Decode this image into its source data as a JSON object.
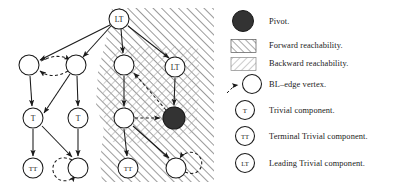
{
  "figure": {
    "colors": {
      "ink": "#1a1a1a",
      "pivot_fill": "#333333",
      "node_fill": "#ffffff",
      "hatch_forward": "#808080",
      "hatch_backward": "#aaaaaa"
    }
  },
  "legend": {
    "items": [
      {
        "key": "pivot",
        "symbol": "filled-circle",
        "label": "Pivot."
      },
      {
        "key": "forward",
        "symbol": "forward-hatch-box",
        "label": "Forward reachability."
      },
      {
        "key": "backward",
        "symbol": "backward-hatch-box",
        "label": "Backward reachability."
      },
      {
        "key": "bl_edge",
        "symbol": "dashed-arrow-circle",
        "label": "BL–edge vertex."
      },
      {
        "key": "trivial",
        "symbol": "circle-T",
        "label": "Trivial component.",
        "node_text": "T"
      },
      {
        "key": "terminal",
        "symbol": "circle-TT",
        "label": "Terminal Trivial component.",
        "node_text": "TT"
      },
      {
        "key": "leading",
        "symbol": "circle-LT",
        "label": "Leading Trivial component.",
        "node_text": "LT"
      }
    ]
  },
  "graph": {
    "nodes": [
      {
        "id": "n_lt_top",
        "label": "LT",
        "x": 119,
        "y": 19,
        "r": 10,
        "fill": "white"
      },
      {
        "id": "n_a",
        "label": "",
        "x": 29,
        "y": 65,
        "r": 10,
        "fill": "white"
      },
      {
        "id": "n_b",
        "label": "",
        "x": 76,
        "y": 65,
        "r": 10,
        "fill": "white"
      },
      {
        "id": "n_c",
        "label": "",
        "x": 124,
        "y": 65,
        "r": 10,
        "fill": "white"
      },
      {
        "id": "n_lt_r",
        "label": "LT",
        "x": 175,
        "y": 67,
        "r": 10,
        "fill": "white"
      },
      {
        "id": "n_t1",
        "label": "T",
        "x": 33,
        "y": 118,
        "r": 10,
        "fill": "white"
      },
      {
        "id": "n_t2",
        "label": "T",
        "x": 78,
        "y": 118,
        "r": 10,
        "fill": "white"
      },
      {
        "id": "n_d",
        "label": "",
        "x": 124,
        "y": 118,
        "r": 10,
        "fill": "white"
      },
      {
        "id": "n_pivot",
        "label": "",
        "x": 174,
        "y": 118,
        "r": 11,
        "fill": "pivot"
      },
      {
        "id": "n_tt1",
        "label": "TT",
        "x": 33,
        "y": 168,
        "r": 10,
        "fill": "white"
      },
      {
        "id": "n_e",
        "label": "",
        "x": 78,
        "y": 168,
        "r": 10,
        "fill": "white"
      },
      {
        "id": "n_tt2",
        "label": "TT",
        "x": 128,
        "y": 168,
        "r": 10,
        "fill": "white"
      },
      {
        "id": "n_f",
        "label": "",
        "x": 176,
        "y": 168,
        "r": 10,
        "fill": "white"
      }
    ],
    "edges": [
      {
        "from": "n_lt_top",
        "to": "n_a",
        "style": "solid"
      },
      {
        "from": "n_lt_top",
        "to": "n_b",
        "style": "solid"
      },
      {
        "from": "n_lt_top",
        "to": "n_c",
        "style": "solid"
      },
      {
        "from": "n_lt_top",
        "to": "n_lt_r",
        "style": "solid"
      },
      {
        "from": "n_a",
        "to": "n_b",
        "style": "dashed-bidirectional"
      },
      {
        "from": "n_a",
        "to": "n_t1",
        "style": "solid"
      },
      {
        "from": "n_b",
        "to": "n_t1",
        "style": "solid"
      },
      {
        "from": "n_b",
        "to": "n_t2",
        "style": "solid"
      },
      {
        "from": "n_c",
        "to": "n_d",
        "style": "solid"
      },
      {
        "from": "n_lt_r",
        "to": "n_pivot",
        "style": "solid"
      },
      {
        "from": "n_pivot",
        "to": "n_c",
        "style": "dashed"
      },
      {
        "from": "n_d",
        "to": "n_pivot",
        "style": "dashed"
      },
      {
        "from": "n_t1",
        "to": "n_tt1",
        "style": "solid"
      },
      {
        "from": "n_t1",
        "to": "n_e",
        "style": "solid"
      },
      {
        "from": "n_t2",
        "to": "n_e",
        "style": "solid"
      },
      {
        "from": "n_d",
        "to": "n_tt2",
        "style": "solid"
      },
      {
        "from": "n_d",
        "to": "n_f",
        "style": "solid"
      },
      {
        "from": "n_e",
        "to": "n_e",
        "style": "dashed-self-loop-left"
      },
      {
        "from": "n_f",
        "to": "n_f",
        "style": "dashed-self-loop-right"
      }
    ]
  }
}
